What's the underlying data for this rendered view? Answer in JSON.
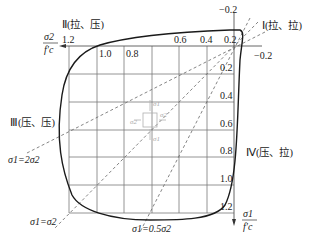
{
  "diagram": {
    "type": "biaxial failure envelope",
    "quadrants": {
      "I": "Ⅰ(拉、拉)",
      "II": "Ⅱ(拉、压)",
      "III": "Ⅲ(压、压)",
      "IV": "Ⅳ(压、拉)"
    },
    "axes": {
      "horizontal": {
        "numerator": "σ2",
        "denominator": "f′c",
        "direction": "left"
      },
      "vertical": {
        "numerator": "σ1",
        "denominator": "f′c",
        "direction": "down"
      }
    },
    "x_ticks": [
      "1.2",
      "1.0",
      "0.8",
      "0.6",
      "0.4",
      "0.2"
    ],
    "x_neg_tick": "−0.2",
    "y_ticks": [
      "0.2",
      "0.4",
      "0.6",
      "0.8",
      "1.0",
      "1.2"
    ],
    "y_neg_tick": "−0.2",
    "lines": {
      "l1": "σ1=2σ2",
      "l2": "σ1=σ2",
      "l3": "σ1=0.5σ2"
    },
    "element": {
      "s1_top": "σ1",
      "s1_bottom": "σ1",
      "s2_left": "σ2",
      "s2_right": "σ2"
    },
    "colors": {
      "curve": "#1a1a1a",
      "grid": "#7a7a7a",
      "dash": "#666666",
      "element": "#b0b0b0"
    }
  }
}
